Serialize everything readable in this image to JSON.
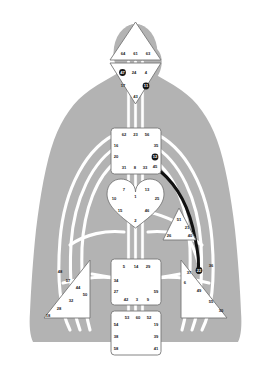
{
  "chart": {
    "type": "human-design-bodygraph",
    "colors": {
      "body_silhouette": "#b3b3b3",
      "center_fill": "#ffffff",
      "center_stroke": "#7a7a7a",
      "channel_inactive": "#ffffff",
      "channel_outline": "#9a9a9a",
      "channel_active": "#111111",
      "gate_text": "#1a1a1a",
      "gate_active_fill": "#151515",
      "gate_active_text": "#ffffff",
      "background": "#ffffff"
    }
  },
  "centers": [
    {
      "name": "head",
      "shape": "triangle-up",
      "state": "undefined",
      "gates": [
        {
          "number": "64",
          "active": false
        },
        {
          "number": "61",
          "active": false
        },
        {
          "number": "63",
          "active": false
        }
      ]
    },
    {
      "name": "ajna",
      "shape": "triangle-down",
      "state": "undefined",
      "gates": [
        {
          "number": "47",
          "active": true
        },
        {
          "number": "24",
          "active": false
        },
        {
          "number": "4",
          "active": false
        },
        {
          "number": "17",
          "active": false
        },
        {
          "number": "11",
          "active": true
        },
        {
          "number": "43",
          "active": false
        }
      ]
    },
    {
      "name": "throat",
      "shape": "square",
      "state": "undefined",
      "gates": [
        {
          "number": "62",
          "active": false
        },
        {
          "number": "23",
          "active": false
        },
        {
          "number": "56",
          "active": false
        },
        {
          "number": "16",
          "active": false
        },
        {
          "number": "35",
          "active": false
        },
        {
          "number": "20",
          "active": false
        },
        {
          "number": "12",
          "active": true
        },
        {
          "number": "45",
          "active": false
        },
        {
          "number": "31",
          "active": false
        },
        {
          "number": "8",
          "active": false
        },
        {
          "number": "33",
          "active": false
        }
      ]
    },
    {
      "name": "g-center",
      "shape": "heart",
      "state": "undefined",
      "gates": [
        {
          "number": "7",
          "active": false
        },
        {
          "number": "13",
          "active": false
        },
        {
          "number": "10",
          "active": false
        },
        {
          "number": "1",
          "active": false
        },
        {
          "number": "25",
          "active": false
        },
        {
          "number": "15",
          "active": false
        },
        {
          "number": "46",
          "active": false
        },
        {
          "number": "2",
          "active": false
        }
      ]
    },
    {
      "name": "ego-heart",
      "shape": "triangle-right",
      "state": "undefined",
      "gates": [
        {
          "number": "51",
          "active": false
        },
        {
          "number": "21",
          "active": false
        },
        {
          "number": "26",
          "active": false
        },
        {
          "number": "40",
          "active": false
        }
      ]
    },
    {
      "name": "spleen",
      "shape": "triangle-left",
      "state": "undefined",
      "gates": [
        {
          "number": "48",
          "active": false
        },
        {
          "number": "57",
          "active": false
        },
        {
          "number": "44",
          "active": false
        },
        {
          "number": "50",
          "active": false
        },
        {
          "number": "32",
          "active": false
        },
        {
          "number": "28",
          "active": false
        },
        {
          "number": "18",
          "active": false
        }
      ]
    },
    {
      "name": "solar-plexus",
      "shape": "triangle-right",
      "state": "undefined",
      "gates": [
        {
          "number": "22",
          "active": true
        },
        {
          "number": "36",
          "active": false
        },
        {
          "number": "37",
          "active": false
        },
        {
          "number": "6",
          "active": false
        },
        {
          "number": "49",
          "active": false
        },
        {
          "number": "55",
          "active": false
        },
        {
          "number": "30",
          "active": false
        }
      ]
    },
    {
      "name": "sacral",
      "shape": "square",
      "state": "undefined",
      "gates": [
        {
          "number": "5",
          "active": false
        },
        {
          "number": "14",
          "active": false
        },
        {
          "number": "29",
          "active": false
        },
        {
          "number": "34",
          "active": false
        },
        {
          "number": "27",
          "active": false
        },
        {
          "number": "59",
          "active": false
        },
        {
          "number": "42",
          "active": false
        },
        {
          "number": "3",
          "active": false
        },
        {
          "number": "9",
          "active": false
        }
      ]
    },
    {
      "name": "root",
      "shape": "square",
      "state": "undefined",
      "gates": [
        {
          "number": "53",
          "active": false
        },
        {
          "number": "60",
          "active": false
        },
        {
          "number": "52",
          "active": false
        },
        {
          "number": "54",
          "active": false
        },
        {
          "number": "19",
          "active": false
        },
        {
          "number": "38",
          "active": false
        },
        {
          "number": "39",
          "active": false
        },
        {
          "number": "58",
          "active": false
        },
        {
          "number": "41",
          "active": false
        }
      ]
    }
  ],
  "gate_labels": {
    "head": {
      "g64": "64",
      "g61": "61",
      "g63": "63"
    },
    "ajna": {
      "g47": "47",
      "g24": "24",
      "g4": "4",
      "g17": "17",
      "g11": "11",
      "g43": "43"
    },
    "throat": {
      "g62": "62",
      "g23": "23",
      "g56": "56",
      "g16": "16",
      "g35": "35",
      "g20": "20",
      "g12": "12",
      "g45": "45",
      "g31": "31",
      "g8": "8",
      "g33": "33"
    },
    "g_center": {
      "g7": "7",
      "g13": "13",
      "g10": "10",
      "g1": "1",
      "g25": "25",
      "g15": "15",
      "g46": "46",
      "g2": "2"
    },
    "ego": {
      "g51": "51",
      "g21": "21",
      "g26": "26",
      "g40": "40"
    },
    "spleen": {
      "g48": "48",
      "g57": "57",
      "g44": "44",
      "g50": "50",
      "g32": "32",
      "g28": "28",
      "g18": "18"
    },
    "solar_plexus": {
      "g22": "22",
      "g36": "36",
      "g37": "37",
      "g6": "6",
      "g49": "49",
      "g55": "55",
      "g30": "30"
    },
    "sacral": {
      "g5": "5",
      "g14": "14",
      "g29": "29",
      "g34": "34",
      "g27": "27",
      "g59": "59",
      "g42": "42",
      "g3": "3",
      "g9": "9"
    },
    "root": {
      "g53": "53",
      "g60": "60",
      "g52": "52",
      "g54": "54",
      "g19": "19",
      "g38": "38",
      "g39": "39",
      "g58": "58",
      "g41": "41"
    }
  },
  "active_channels": [
    {
      "from": "12",
      "to": "22",
      "name": "channel-of-openness"
    }
  ]
}
